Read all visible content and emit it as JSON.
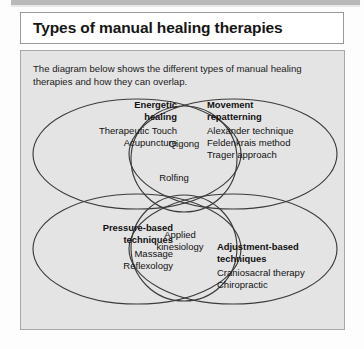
{
  "page": {
    "title": "Types of manual healing therapies",
    "intro": "The diagram below shows the different types of manual healing therapies and how they can overlap."
  },
  "colors": {
    "page_background": "#fdfdfd",
    "panel_background": "#e4e4e4",
    "panel_border": "#a8a8a8",
    "title_background": "#ffffff",
    "title_border": "#9a9a9a",
    "text": "#111111",
    "stroke": "#3b3b3b",
    "top_band": "#b9b9b9"
  },
  "diagram": {
    "type": "venn",
    "set_count": 6,
    "sets": [
      {
        "id": "energetic-healing",
        "heading": "Energetic healing",
        "heading_line1": "Energetic",
        "heading_line2": "healing",
        "items": [
          "Therapeutic Touch",
          "Acupuncture"
        ],
        "align": "right",
        "shape": "ellipse",
        "position": "top-left"
      },
      {
        "id": "movement-repatterning",
        "heading": "Movement repatterning",
        "heading_line1": "Movement",
        "heading_line2": "repatterning",
        "items": [
          "Alexander technique",
          "Feldenkrais method",
          "Trager approach"
        ],
        "align": "left",
        "shape": "ellipse",
        "position": "top-right"
      },
      {
        "id": "pressure-based-techniques",
        "heading": "Pressure-based techniques",
        "heading_line1": "Pressure-based",
        "heading_line2": "techniques",
        "items": [
          "Massage",
          "Reflexology"
        ],
        "align": "right",
        "shape": "ellipse",
        "position": "bottom-left"
      },
      {
        "id": "adjustment-based-techniques",
        "heading": "Adjustment-based techniques",
        "heading_line1": "Adjustment-based",
        "heading_line2": "techniques",
        "items": [
          "Craniosacral therapy",
          "Chiropractic"
        ],
        "align": "left",
        "shape": "ellipse",
        "position": "bottom-right"
      },
      {
        "id": "upper-overlap-circle",
        "heading": "",
        "items": [
          "Qigong"
        ],
        "align": "center",
        "shape": "circle",
        "position": "centre-top",
        "style": "italic"
      },
      {
        "id": "lower-overlap-circle",
        "heading": "",
        "items": [
          "Applied kinesiology"
        ],
        "align": "center",
        "shape": "circle",
        "position": "centre-bottom"
      }
    ],
    "overlap_labels": [
      {
        "id": "qigong",
        "text": "Qigong",
        "italic": true,
        "between": [
          "energetic-healing",
          "movement-repatterning"
        ]
      },
      {
        "id": "rolfing",
        "text": "Rolfing",
        "italic": false,
        "between": [
          "energetic-healing",
          "movement-repatterning",
          "pressure-based-techniques",
          "adjustment-based-techniques"
        ]
      },
      {
        "id": "applied-kinesiology",
        "text": "Applied kinesiology",
        "italic": false,
        "between": [
          "pressure-based-techniques",
          "adjustment-based-techniques"
        ]
      }
    ]
  }
}
